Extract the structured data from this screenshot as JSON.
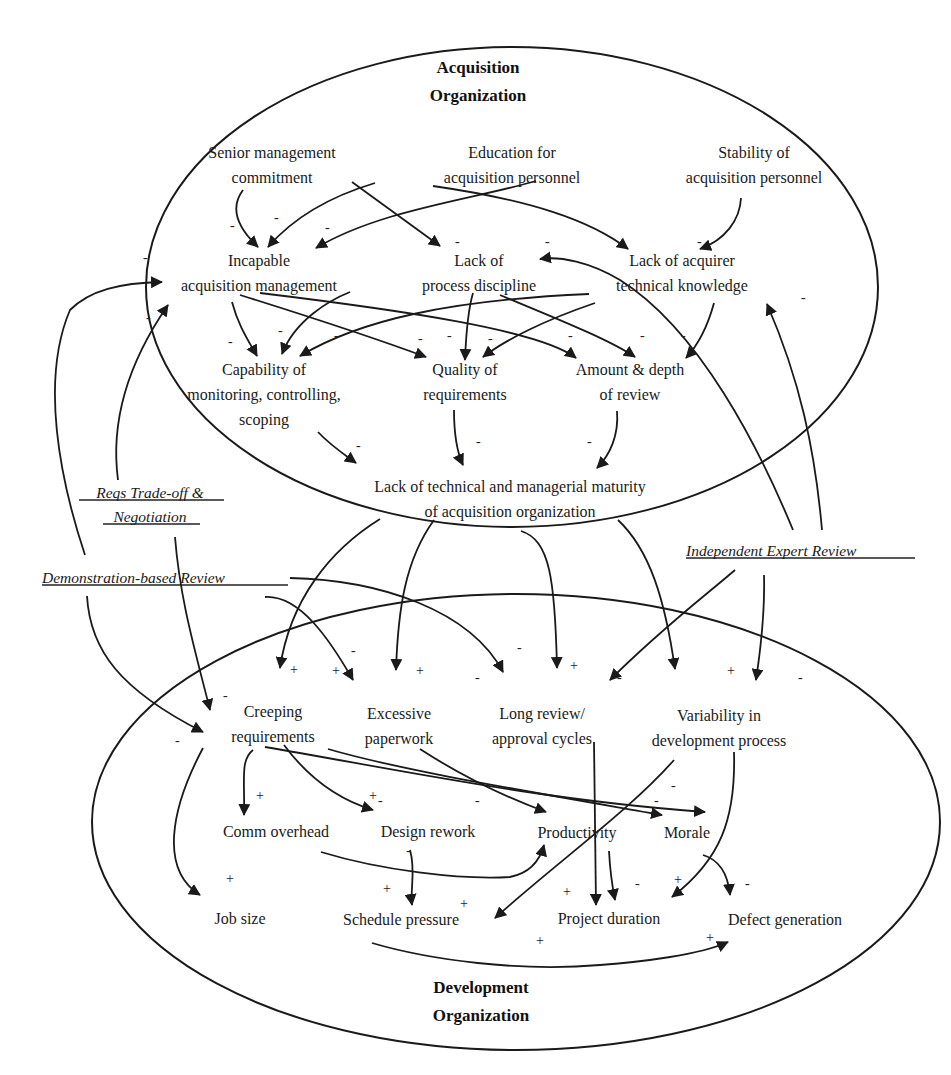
{
  "organizations": {
    "acquisition": {
      "line1": "Acquisition",
      "line2": "Organization"
    },
    "development": {
      "line1": "Development",
      "line2": "Organization"
    }
  },
  "nodes": {
    "senior_mgmt": [
      "Senior management",
      "commitment"
    ],
    "education": [
      "Education for",
      "acquisition personnel"
    ],
    "stability": [
      "Stability of",
      "acquisition personnel"
    ],
    "incapable_mgmt": [
      "Incapable",
      "acquisition management"
    ],
    "lack_discipline": [
      "Lack of",
      "process discipline"
    ],
    "lack_knowledge": [
      "Lack of acquirer",
      "technical knowledge"
    ],
    "capability_monitoring": [
      "Capability of",
      "monitoring, controlling,",
      "scoping"
    ],
    "quality_reqs": [
      "Quality of",
      "requirements"
    ],
    "amount_review": [
      "Amount & depth",
      "of review"
    ],
    "lack_maturity": [
      "Lack of technical and managerial maturity",
      "of acquisition organization"
    ],
    "creeping_reqs": [
      "Creeping",
      "requirements"
    ],
    "excessive_paperwork": [
      "Excessive",
      "paperwork"
    ],
    "long_review": [
      "Long review/",
      "approval cycles"
    ],
    "variability": [
      "Variability in",
      "development process"
    ],
    "comm_overhead": [
      "Comm overhead"
    ],
    "design_rework": [
      "Design rework"
    ],
    "productivity": [
      "Productivity"
    ],
    "morale": [
      "Morale"
    ],
    "job_size": [
      "Job size"
    ],
    "schedule_pressure": [
      "Schedule pressure"
    ],
    "project_duration": [
      "Project duration"
    ],
    "defect_generation": [
      "Defect generation"
    ]
  },
  "policies": {
    "reqs_tradeoff": [
      "Reqs Trade-off &",
      "Negotiation"
    ],
    "demo_review": [
      "Demonstration-based Review"
    ],
    "expert_review": [
      "Independent Expert Review"
    ]
  },
  "edges": [
    {
      "from": "Senior management commitment",
      "to": "Incapable acquisition management",
      "sign": "-"
    },
    {
      "from": "Senior management commitment",
      "to": "Lack of process discipline",
      "sign": "-"
    },
    {
      "from": "Education for acquisition personnel",
      "to": "Incapable acquisition management",
      "sign": "-"
    },
    {
      "from": "Education for acquisition personnel",
      "to": "Lack of acquirer technical knowledge",
      "sign": "-"
    },
    {
      "from": "Stability of acquisition personnel",
      "to": "Incapable acquisition management",
      "sign": "-"
    },
    {
      "from": "Stability of acquisition personnel",
      "to": "Lack of acquirer technical knowledge",
      "sign": "-"
    },
    {
      "from": "Incapable acquisition management",
      "to": "Capability of monitoring, controlling, scoping",
      "sign": "-"
    },
    {
      "from": "Incapable acquisition management",
      "to": "Quality of requirements",
      "sign": "-"
    },
    {
      "from": "Incapable acquisition management",
      "to": "Amount & depth of review",
      "sign": "-"
    },
    {
      "from": "Lack of process discipline",
      "to": "Capability of monitoring, controlling, scoping",
      "sign": "-"
    },
    {
      "from": "Lack of process discipline",
      "to": "Quality of requirements",
      "sign": "-"
    },
    {
      "from": "Lack of process discipline",
      "to": "Amount & depth of review",
      "sign": "-"
    },
    {
      "from": "Lack of acquirer technical knowledge",
      "to": "Capability of monitoring, controlling, scoping",
      "sign": "-"
    },
    {
      "from": "Lack of acquirer technical knowledge",
      "to": "Quality of requirements",
      "sign": "-"
    },
    {
      "from": "Lack of acquirer technical knowledge",
      "to": "Amount & depth of review",
      "sign": "-"
    },
    {
      "from": "Capability of monitoring, controlling, scoping",
      "to": "Lack of technical and managerial maturity",
      "sign": "-"
    },
    {
      "from": "Quality of requirements",
      "to": "Lack of technical and managerial maturity",
      "sign": "-"
    },
    {
      "from": "Amount & depth of review",
      "to": "Lack of technical and managerial maturity",
      "sign": "-"
    },
    {
      "from": "Lack of technical and managerial maturity",
      "to": "Creeping requirements",
      "sign": "+"
    },
    {
      "from": "Lack of technical and managerial maturity",
      "to": "Excessive paperwork",
      "sign": "+"
    },
    {
      "from": "Lack of technical and managerial maturity",
      "to": "Long review/approval cycles",
      "sign": "+"
    },
    {
      "from": "Lack of technical and managerial maturity",
      "to": "Variability in development process",
      "sign": "+"
    },
    {
      "from": "Reqs Trade-off & Negotiation",
      "to": "Incapable acquisition management",
      "sign": "-"
    },
    {
      "from": "Reqs Trade-off & Negotiation",
      "to": "Creeping requirements",
      "sign": "-"
    },
    {
      "from": "Demonstration-based Review",
      "to": "Incapable acquisition management",
      "sign": "-"
    },
    {
      "from": "Demonstration-based Review",
      "to": "Creeping requirements",
      "sign": "-"
    },
    {
      "from": "Demonstration-based Review",
      "to": "Excessive paperwork",
      "sign": "-"
    },
    {
      "from": "Demonstration-based Review",
      "to": "Long review/approval cycles",
      "sign": "-"
    },
    {
      "from": "Independent Expert Review",
      "to": "Lack of process discipline",
      "sign": "-"
    },
    {
      "from": "Independent Expert Review",
      "to": "Lack of acquirer technical knowledge",
      "sign": "-"
    },
    {
      "from": "Independent Expert Review",
      "to": "Long review/approval cycles",
      "sign": "-"
    },
    {
      "from": "Independent Expert Review",
      "to": "Variability in development process",
      "sign": "-"
    },
    {
      "from": "Creeping requirements",
      "to": "Comm overhead",
      "sign": "+"
    },
    {
      "from": "Creeping requirements",
      "to": "Design rework",
      "sign": "+"
    },
    {
      "from": "Creeping requirements",
      "to": "Job size",
      "sign": "+"
    },
    {
      "from": "Creeping requirements",
      "to": "Morale",
      "sign": "-"
    },
    {
      "from": "Excessive paperwork",
      "to": "Productivity",
      "sign": "-"
    },
    {
      "from": "Excessive paperwork",
      "to": "Morale",
      "sign": "-"
    },
    {
      "from": "Long review/approval cycles",
      "to": "Project duration",
      "sign": "+"
    },
    {
      "from": "Variability in development process",
      "to": "Schedule pressure",
      "sign": "+"
    },
    {
      "from": "Variability in development process",
      "to": "Project duration",
      "sign": "+"
    },
    {
      "from": "Comm overhead",
      "to": "Productivity",
      "sign": "-"
    },
    {
      "from": "Design rework",
      "to": "Schedule pressure",
      "sign": "+"
    },
    {
      "from": "Productivity",
      "to": "Project duration",
      "sign": "-"
    },
    {
      "from": "Morale",
      "to": "Defect generation",
      "sign": "-"
    },
    {
      "from": "Schedule pressure",
      "to": "Defect generation",
      "sign": "+"
    }
  ],
  "signs": {
    "minus": "-",
    "plus": "+"
  }
}
